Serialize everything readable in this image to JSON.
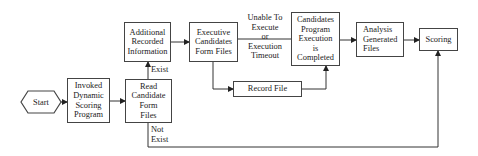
{
  "diagram": {
    "type": "flowchart",
    "nodes": {
      "start": {
        "label": "Start",
        "shape": "hexagon"
      },
      "invoked": {
        "label": "Invoked\nDynamic\nScoring\nProgram"
      },
      "read": {
        "label": "Read\nCandidate\nForm\nFiles"
      },
      "additional": {
        "label": "Additional\nRecorded\nInformation"
      },
      "executive": {
        "label": "Executive\nCandidates\nForm Files"
      },
      "completed": {
        "label": "Candidates\nProgram\nExecution\nis\nCompleted"
      },
      "record": {
        "label": "Record File"
      },
      "analysis": {
        "label": "Analysis\nGenerated\nFiles"
      },
      "scoring": {
        "label": "Scoring"
      }
    },
    "edge_labels": {
      "exist": "Exist",
      "not_exist": "Not\nExist",
      "unable": "Unable To\nExecute\nor\nExecution\nTimeout"
    },
    "edges": [
      {
        "from": "start",
        "to": "invoked"
      },
      {
        "from": "invoked",
        "to": "read"
      },
      {
        "from": "read",
        "to": "additional",
        "label": "Exist"
      },
      {
        "from": "read",
        "to": "scoring",
        "label": "Not Exist"
      },
      {
        "from": "additional",
        "to": "executive"
      },
      {
        "from": "executive",
        "to": "completed",
        "label": "Unable To Execute or Execution Timeout"
      },
      {
        "from": "executive",
        "to": "record"
      },
      {
        "from": "record",
        "to": "completed"
      },
      {
        "from": "completed",
        "to": "analysis"
      },
      {
        "from": "analysis",
        "to": "scoring"
      }
    ],
    "colors": {
      "line": "#444444",
      "background": "#ffffff",
      "text": "#222222"
    }
  }
}
